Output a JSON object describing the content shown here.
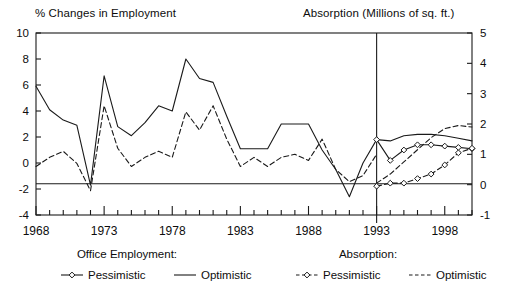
{
  "figure": {
    "title_left": "% Changes in Employment",
    "title_right": "Absorption (Millions of sq. ft.)"
  },
  "legend": {
    "group1_title": "Office Employment:",
    "group1_items": [
      {
        "label": "Pessimistic",
        "style": "solid-with-open-diamond-markers"
      },
      {
        "label": "Optimistic",
        "style": "solid"
      }
    ],
    "group2_title": "Absorption:",
    "group2_items": [
      {
        "label": "Pessimistic",
        "style": "dashed-with-open-diamond-markers"
      },
      {
        "label": "Optimistic",
        "style": "dashed"
      }
    ]
  },
  "chart_data": {
    "type": "line",
    "xlabel": "",
    "ylabel": "% Changes in Employment",
    "y2label": "Absorption (Millions of sq. ft.)",
    "xlim": [
      1968,
      2000
    ],
    "ylim": [
      -4,
      10
    ],
    "y2lim": [
      -1,
      5
    ],
    "grid": false,
    "legend_position": "below-plot",
    "xticks_major": [
      1968,
      1973,
      1978,
      1983,
      1988,
      1993,
      1998
    ],
    "xtick_labels": [
      "1968",
      "1973",
      "1978",
      "1983",
      "1988",
      "1993",
      "1998"
    ],
    "xticks_minor_interval": 1,
    "yticks_left": [
      -4,
      -2,
      0,
      2,
      4,
      6,
      8,
      10
    ],
    "ytick_labels_left": [
      "-4",
      "-2",
      "0",
      "2",
      "4",
      "6",
      "8",
      "10"
    ],
    "yticks_right": [
      -1,
      0,
      1,
      2,
      3,
      4,
      5
    ],
    "ytick_labels_right": [
      "-1",
      "0",
      "1",
      "2",
      "3",
      "4",
      "5"
    ],
    "annotations": [
      {
        "kind": "vertical-line",
        "x": 1993,
        "note": "forecast start divider"
      },
      {
        "kind": "horizontal-line",
        "y_left": -1.6,
        "y_right": 0,
        "note": "zero absorption reference"
      }
    ],
    "series": [
      {
        "name": "Office Employment: Optimistic",
        "axis": "left",
        "style": "solid",
        "markers": false,
        "x": [
          1968,
          1969,
          1970,
          1971,
          1972,
          1973,
          1974,
          1975,
          1976,
          1977,
          1978,
          1979,
          1980,
          1981,
          1982,
          1983,
          1984,
          1985,
          1986,
          1987,
          1988,
          1989,
          1990,
          1991,
          1992,
          1993
        ],
        "values": [
          5.9,
          4.1,
          3.3,
          2.9,
          -1.7,
          6.7,
          2.8,
          2.1,
          3.1,
          4.4,
          4.0,
          8.0,
          6.5,
          6.2,
          3.6,
          1.1,
          1.1,
          1.1,
          3.0,
          3.0,
          3.0,
          1.0,
          -0.5,
          -2.6,
          0.0,
          1.8
        ]
      },
      {
        "name": "Office Employment: Optimistic (forecast)",
        "axis": "left",
        "style": "solid",
        "markers": false,
        "x": [
          1993,
          1994,
          1995,
          1996,
          1997,
          1998,
          1999,
          2000
        ],
        "values": [
          1.8,
          1.7,
          2.1,
          2.2,
          2.2,
          2.1,
          1.9,
          1.7
        ]
      },
      {
        "name": "Office Employment: Pessimistic (forecast)",
        "axis": "left",
        "style": "solid",
        "markers": "open-diamond",
        "x": [
          1993,
          1994,
          1995,
          1996,
          1997,
          1998,
          1999,
          2000
        ],
        "values": [
          1.8,
          0.2,
          1.0,
          1.4,
          1.4,
          1.3,
          1.2,
          1.1
        ]
      },
      {
        "name": "Absorption: Optimistic",
        "axis": "right",
        "style": "dashed",
        "markers": false,
        "x": [
          1968,
          1969,
          1970,
          1971,
          1972,
          1973,
          1974,
          1975,
          1976,
          1977,
          1978,
          1979,
          1980,
          1981,
          1982,
          1983,
          1984,
          1985,
          1986,
          1987,
          1988,
          1989,
          1990,
          1991,
          1992,
          1993
        ],
        "values": [
          0.6,
          0.9,
          1.1,
          0.7,
          -0.2,
          2.6,
          1.2,
          0.6,
          0.9,
          1.1,
          0.9,
          2.4,
          1.8,
          2.6,
          1.5,
          0.6,
          0.9,
          0.6,
          0.9,
          1.0,
          0.8,
          1.5,
          0.5,
          0.1,
          0.3,
          1.0
        ]
      },
      {
        "name": "Absorption: Optimistic (forecast)",
        "axis": "right",
        "style": "dashed",
        "markers": false,
        "x": [
          1993,
          1994,
          1995,
          1996,
          1997,
          1998,
          1999,
          2000
        ],
        "values": [
          0.05,
          0.35,
          0.75,
          1.15,
          1.55,
          1.85,
          1.95,
          1.9
        ]
      },
      {
        "name": "Absorption: Pessimistic (forecast)",
        "axis": "right",
        "style": "dashed",
        "markers": "open-diamond",
        "x": [
          1993,
          1994,
          1995,
          1996,
          1997,
          1998,
          1999,
          2000
        ],
        "values": [
          -0.05,
          0.05,
          0.05,
          0.2,
          0.35,
          0.65,
          1.05,
          1.2
        ]
      }
    ]
  }
}
